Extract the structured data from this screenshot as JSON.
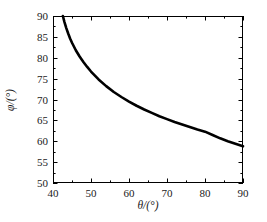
{
  "chart_data": {
    "type": "line",
    "title": "",
    "subtitle": "",
    "xlabel": "θ/(°)",
    "ylabel": "φ/(°)",
    "xlim": [
      40,
      90
    ],
    "ylim": [
      50,
      90
    ],
    "xticks": [
      40,
      50,
      60,
      70,
      80,
      90
    ],
    "xtick_labels": [
      "40",
      "50",
      "60",
      "70",
      "80",
      "90"
    ],
    "yticks": [
      50,
      55,
      60,
      65,
      70,
      75,
      80,
      85,
      90
    ],
    "ytick_labels": [
      "50",
      "55",
      "60",
      "65",
      "70",
      "75",
      "80",
      "85",
      "90"
    ],
    "x_minor_tick_interval": 5,
    "y_minor_tick_interval": 2.5,
    "grid": false,
    "legend": null,
    "annotations": [],
    "series": [
      {
        "name": "phi vs theta",
        "color": "#000000",
        "line_width": 2.6,
        "x": [
          42.6,
          43.0,
          43.5,
          44.0,
          44.5,
          45.0,
          46.0,
          47.0,
          48.0,
          49.0,
          50.0,
          52.0,
          54.0,
          56.0,
          58.0,
          60.0,
          62.0,
          64.0,
          66.0,
          68.0,
          70.0,
          72.0,
          74.0,
          76.0,
          78.0,
          80.0,
          82.0,
          84.0,
          86.0,
          88.0,
          90.0
        ],
        "y": [
          90.0,
          88.6,
          87.1,
          85.8,
          84.6,
          83.6,
          81.8,
          80.3,
          79.0,
          77.8,
          76.7,
          74.8,
          73.2,
          71.8,
          70.6,
          69.5,
          68.5,
          67.6,
          66.8,
          66.0,
          65.3,
          64.6,
          64.0,
          63.4,
          62.8,
          62.3,
          61.5,
          60.7,
          60.0,
          59.4,
          58.8
        ]
      }
    ]
  },
  "axes_geometry": {
    "left_px": 53,
    "right_px": 243,
    "top_px": 16,
    "bottom_px": 183,
    "frame_color": "#000000",
    "frame_width": 1
  }
}
